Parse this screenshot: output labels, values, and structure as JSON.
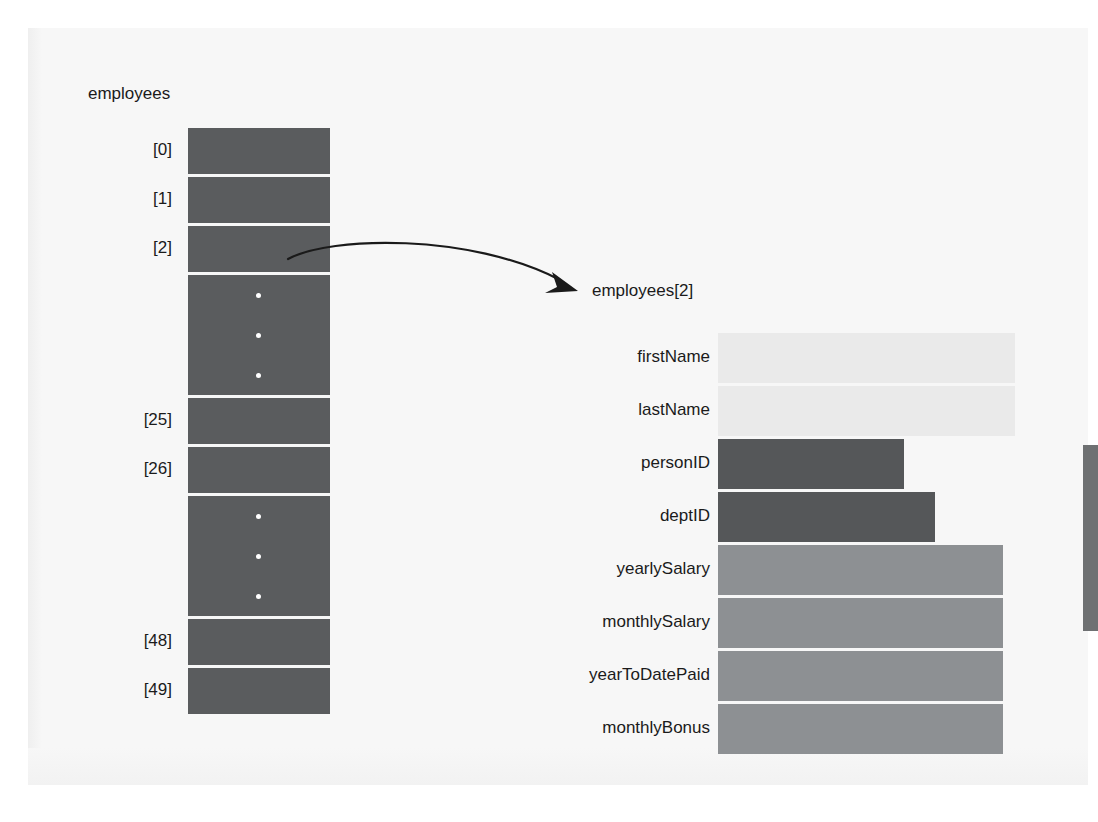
{
  "diagram": {
    "type": "array-of-records",
    "array": {
      "name": "employees",
      "size": 50,
      "cells": [
        {
          "label": "[0]",
          "kind": "element"
        },
        {
          "label": "[1]",
          "kind": "element"
        },
        {
          "label": "[2]",
          "kind": "element"
        },
        {
          "label": "",
          "kind": "ellipsis"
        },
        {
          "label": "[25]",
          "kind": "element"
        },
        {
          "label": "[26]",
          "kind": "element"
        },
        {
          "label": "",
          "kind": "ellipsis"
        },
        {
          "label": "[48]",
          "kind": "element"
        },
        {
          "label": "[49]",
          "kind": "element"
        }
      ]
    },
    "record": {
      "caption": "employees[2]",
      "fields": [
        {
          "name": "firstName",
          "shade": "light"
        },
        {
          "name": "lastName",
          "shade": "light"
        },
        {
          "name": "personID",
          "shade": "dark"
        },
        {
          "name": "deptID",
          "shade": "dark"
        },
        {
          "name": "yearlySalary",
          "shade": "medium"
        },
        {
          "name": "monthlySalary",
          "shade": "medium"
        },
        {
          "name": "yearToDatePaid",
          "shade": "medium"
        },
        {
          "name": "monthlyBonus",
          "shade": "medium"
        }
      ]
    },
    "colors": {
      "array_cell": "#5a5c5e",
      "bar_light": "#eaeaea",
      "bar_dark": "#555759",
      "bar_medium": "#8d9093",
      "page_background": "#f7f7f7",
      "text": "#1b1b1b",
      "edge_tab": "#6e7072"
    }
  }
}
